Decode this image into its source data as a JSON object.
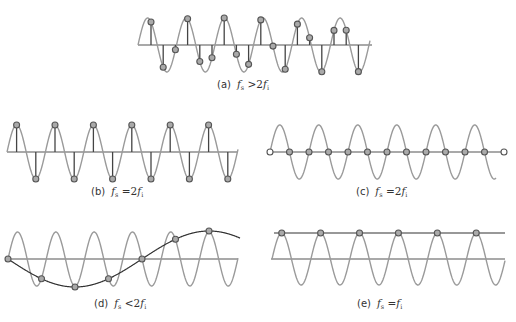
{
  "figure": {
    "colors": {
      "signal": "#9a9a9a",
      "axis": "#555555",
      "stem": "#444444",
      "marker_stroke": "#555555",
      "marker_fill": "#aaaaaa",
      "alias": "#333333"
    },
    "panels": [
      {
        "id": "a",
        "label": "(a)",
        "condition_lhs": "f",
        "lhs_sub": "s",
        "operator": ">",
        "rhs_coef": "2",
        "rhs": "f",
        "rhs_sub": "i",
        "description": "Sampling rate greater than twice the signal frequency"
      },
      {
        "id": "b",
        "label": "(b)",
        "condition_lhs": "f",
        "lhs_sub": "s",
        "operator": "=",
        "rhs_coef": "2",
        "rhs": "f",
        "rhs_sub": "i",
        "description": "Sampling at twice the frequency, samples at peaks and troughs"
      },
      {
        "id": "c",
        "label": "(c)",
        "condition_lhs": "f",
        "lhs_sub": "s",
        "operator": "=",
        "rhs_coef": "2",
        "rhs": "f",
        "rhs_sub": "i",
        "description": "Sampling at twice the frequency, samples at zero crossings"
      },
      {
        "id": "d",
        "label": "(d)",
        "condition_lhs": "f",
        "lhs_sub": "s",
        "operator": "<",
        "rhs_coef": "2",
        "rhs": "f",
        "rhs_sub": "i",
        "description": "Undersampling produces a low-frequency alias"
      },
      {
        "id": "e",
        "label": "(e)",
        "condition_lhs": "f",
        "lhs_sub": "s",
        "operator": "=",
        "rhs_coef": "",
        "rhs": "f",
        "rhs_sub": "i",
        "description": "Sampling at signal frequency yields a constant (DC)"
      }
    ]
  }
}
